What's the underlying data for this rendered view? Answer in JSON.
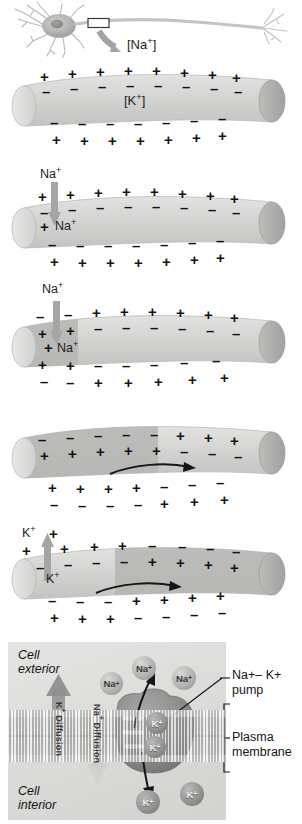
{
  "figure": {
    "neuron": {
      "name": "neuron-illustration",
      "callout_label": "[Na+]",
      "callout_box": "axon-magnification-box"
    },
    "colors": {
      "axon_resting": "#d9d9d7",
      "axon_depolarized": "#b4b4b2",
      "axon_end_cap": "#a9a9a7",
      "arrow_gray": "#a3a3a1",
      "sign_black": "#121212",
      "pump_body": "#9a9a98",
      "membrane_band": "#cfcfcd",
      "panel_bg": "#dededc"
    },
    "panels": [
      {
        "id": "panel-1-resting",
        "caption_labels": [
          "[K+]"
        ],
        "state": "resting potential",
        "outside_top": [
          "+",
          "+",
          "+",
          "+",
          "+",
          "+",
          "+",
          "+"
        ],
        "inside_top": [
          "-",
          "-",
          "-",
          "-",
          "-",
          "-",
          "-",
          "-"
        ],
        "inside_bottom": [
          "-",
          "-",
          "-",
          "-",
          "-",
          "-",
          "-"
        ],
        "outside_bottom": [
          "+",
          "+",
          "+",
          "+",
          "+",
          "+",
          "+"
        ],
        "ion_arrow": null,
        "impulse_arrow": false
      },
      {
        "id": "panel-2-stimulus",
        "caption_labels": [
          "Na+",
          "Na+"
        ],
        "state": "sodium influx begins",
        "outside_top": [
          "+",
          "+",
          "+",
          "+",
          "+",
          "+",
          "+",
          "+"
        ],
        "inside_top": [
          "-",
          "-",
          "-",
          "-",
          "-",
          "-",
          "-",
          "-"
        ],
        "inside_bottom": [
          "-",
          "-",
          "-",
          "-",
          "-",
          "-",
          "-"
        ],
        "outside_bottom": [
          "+",
          "+",
          "+",
          "+",
          "+",
          "+",
          "+"
        ],
        "ion_arrow": {
          "ion": "Na+",
          "direction": "in",
          "label_outside": "Na+",
          "label_inside": "Na+"
        },
        "impulse_arrow": false
      },
      {
        "id": "panel-3-depolarization",
        "caption_labels": [
          "Na+",
          "Na+"
        ],
        "state": "local depolarization / polarity reversal",
        "outside_top": [
          "-",
          "-",
          "+",
          "+",
          "+",
          "+",
          "+",
          "+"
        ],
        "inside_top": [
          "+",
          "+",
          "-",
          "-",
          "-",
          "-",
          "-",
          "-"
        ],
        "inside_bottom": [
          "+",
          "+",
          "-",
          "-",
          "-",
          "-",
          "-"
        ],
        "outside_bottom": [
          "-",
          "-",
          "+",
          "+",
          "+",
          "+",
          "+"
        ],
        "ion_arrow": {
          "ion": "Na+",
          "direction": "in",
          "label_outside": "Na+",
          "label_inside": "Na+"
        },
        "impulse_arrow": false
      },
      {
        "id": "panel-4-propagation",
        "caption_labels": [],
        "state": "impulse travels along axon",
        "outside_top": [
          "-",
          "-",
          "-",
          "-",
          "-",
          "+",
          "+",
          "+"
        ],
        "inside_top": [
          "+",
          "+",
          "+",
          "+",
          "+",
          "-",
          "-",
          "-"
        ],
        "inside_bottom": [
          "+",
          "+",
          "+",
          "+",
          "-",
          "-",
          "-"
        ],
        "outside_bottom": [
          "-",
          "-",
          "-",
          "-",
          "+",
          "+",
          "+"
        ],
        "ion_arrow": null,
        "impulse_arrow": true
      },
      {
        "id": "panel-5-repolarization",
        "caption_labels": [
          "K+",
          "K+"
        ],
        "state": "repolarization by potassium efflux",
        "outside_top": [
          "+",
          "+",
          "+",
          "+",
          "-",
          "-",
          "-",
          "-"
        ],
        "inside_top": [
          "-",
          "-",
          "-",
          "-",
          "+",
          "+",
          "+",
          "+"
        ],
        "inside_bottom": [
          "-",
          "-",
          "-",
          "+",
          "+",
          "+",
          "+"
        ],
        "outside_bottom": [
          "+",
          "+",
          "+",
          "-",
          "-",
          "-",
          "-"
        ],
        "ion_arrow": {
          "ion": "K+",
          "direction": "out",
          "label_outside": "K+",
          "label_inside": "K+"
        },
        "impulse_arrow": true
      }
    ],
    "pump_diagram": {
      "id": "pump-panel",
      "cell_exterior_label": "Cell\nexterior",
      "cell_exterior_line1": "Cell",
      "cell_exterior_line2": "exterior",
      "cell_interior_line1": "Cell",
      "cell_interior_line2": "interior",
      "k_diffusion_label": "K+ Diffusion",
      "na_diffusion_label": "Na+ Diffusion",
      "pump_label_line1": "Na+– K+",
      "pump_label_line2": "pump",
      "membrane_label_line1": "Plasma",
      "membrane_label_line2": "membrane",
      "exterior_ions": [
        "Na+",
        "Na+",
        "Na+"
      ],
      "pump_bound_ions": [
        "K+",
        "K+"
      ],
      "interior_ions": [
        "K+",
        "K+"
      ],
      "arrows": [
        {
          "name": "na-efflux-arrow",
          "ion": "Na+",
          "direction": "out"
        },
        {
          "name": "k-influx-arrow",
          "ion": "K+",
          "direction": "in"
        },
        {
          "name": "k-diffusion-arrow",
          "direction": "up"
        },
        {
          "name": "na-diffusion-arrow",
          "direction": "down"
        }
      ]
    }
  }
}
